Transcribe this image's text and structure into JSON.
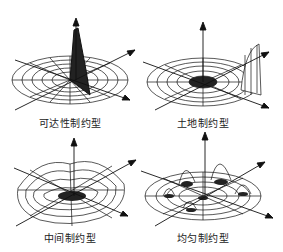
{
  "figure": {
    "panels": [
      {
        "id": "accessibility",
        "label": "可达性制约型",
        "peak": "single sharp central spike"
      },
      {
        "id": "land",
        "label": "土地制约型",
        "peak": "raised outer rim on one side"
      },
      {
        "id": "intermediate",
        "label": "中间制约型",
        "peak": "moderate undulating surface"
      },
      {
        "id": "uniform",
        "label": "均匀制约型",
        "peak": "multiple evenly distributed peaks"
      }
    ],
    "colors": {
      "line": "#111111",
      "background": "#ffffff"
    }
  }
}
